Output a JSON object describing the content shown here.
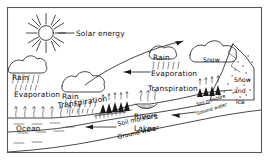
{
  "diagram": {
    "background_color": "#ffffff",
    "ink_color": "#1a1a1a",
    "frame_color": "#5a5a5a",
    "labels": {
      "solar_energy": "Solar energy",
      "rain_left": "Rain",
      "rain_center": "Rain",
      "rain_right": "Rain",
      "evaporation_ocean": "Evaporation",
      "evaporation_right": "Evaporation",
      "transpiration_center": "Transpiration",
      "transpiration_right": "Transpiration",
      "snow_cloud": "Snow",
      "snow_word": "Snow",
      "and_word": "and",
      "ice_word": "ice",
      "ocean": "Ocean",
      "soil_moisture_left": "Soil moisture",
      "ground_water_left": "Ground water",
      "soil_moisture_right": "Soil moisture",
      "ground_water_right": "Ground water",
      "rivers": "Rivers",
      "lakes": "Lakes"
    },
    "icons": {
      "sun": "sun-icon",
      "cloud_left": "cloud-icon",
      "cloud_center": "cloud-icon",
      "cloud_right": "cloud-icon",
      "mountain": "mountain-icon",
      "trees": "trees-icon",
      "rain_streaks": "rain-icon",
      "arrow": "arrow-icon"
    }
  }
}
